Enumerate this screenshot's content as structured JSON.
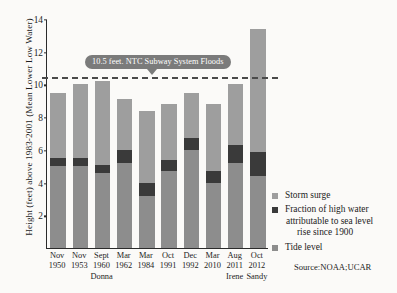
{
  "chart_data": {
    "type": "bar",
    "title": "",
    "subtitle": "",
    "xlabel": "",
    "ylabel": "Height (feet) above 1983-2001 (Mean Lower Low Water)",
    "ylim": [
      0,
      14
    ],
    "yticks": [
      2,
      4,
      6,
      8,
      10,
      12,
      14
    ],
    "grid": false,
    "stacked": true,
    "legend_position": "right",
    "categories": [
      "Nov 1950",
      "Nov 1953",
      "Sept 1960",
      "Mar 1962",
      "Mar 1984",
      "Oct 1991",
      "Dec 1992",
      "Mar 2010",
      "Aug 2011",
      "Oct 2012"
    ],
    "category_lines": [
      {
        "month": "Nov",
        "year": "1950",
        "storm": ""
      },
      {
        "month": "Nov",
        "year": "1953",
        "storm": ""
      },
      {
        "month": "Sept",
        "year": "1960",
        "storm": "Donna"
      },
      {
        "month": "Mar",
        "year": "1962",
        "storm": ""
      },
      {
        "month": "Mar",
        "year": "1984",
        "storm": ""
      },
      {
        "month": "Oct",
        "year": "1991",
        "storm": ""
      },
      {
        "month": "Dec",
        "year": "1992",
        "storm": ""
      },
      {
        "month": "Mar",
        "year": "2010",
        "storm": ""
      },
      {
        "month": "Aug",
        "year": "2011",
        "storm": "Irene"
      },
      {
        "month": "Oct",
        "year": "2012",
        "storm": "Sandy"
      }
    ],
    "series": [
      {
        "name": "Tide level",
        "color": "#8d8d8d",
        "values": [
          5.0,
          5.0,
          4.6,
          5.2,
          3.2,
          4.7,
          6.0,
          4.0,
          5.2,
          4.4
        ]
      },
      {
        "name": "Fraction of high water attributable to sea level rise since 1900",
        "color": "#3a3a3a",
        "values": [
          0.5,
          0.5,
          0.5,
          0.8,
          0.8,
          0.7,
          0.7,
          0.7,
          1.1,
          1.5
        ]
      },
      {
        "name": "Storm surge",
        "color": "#9e9e9e",
        "values": [
          4.0,
          4.5,
          5.1,
          3.1,
          4.4,
          3.4,
          2.8,
          4.1,
          3.7,
          7.5
        ]
      }
    ],
    "totals": [
      9.5,
      10.0,
      10.2,
      9.1,
      8.4,
      8.8,
      9.5,
      8.8,
      10.0,
      13.4
    ],
    "annotations": [
      {
        "name": "subway-flood-threshold",
        "label": "10.5 feet. NTC Subway System Floods",
        "value": 10.5,
        "style": "dashed-line-with-callout",
        "line_color": "#4a4a4a",
        "callout_bg": "#7b7b7b",
        "callout_fg": "#ffffff"
      }
    ],
    "legend": [
      {
        "label": "Storm surge",
        "color": "#9e9e9e",
        "lines": [
          "Storm surge"
        ]
      },
      {
        "label": "Fraction of high water attributable to sea level rise since 1900",
        "color": "#3a3a3a",
        "lines": [
          "Fraction of high water",
          "attributable to sea level",
          "rise since 1900"
        ]
      },
      {
        "label": "Tide level",
        "color": "#8d8d8d",
        "lines": [
          "Tide level"
        ]
      }
    ],
    "source": "Source:NOAA;UCAR"
  }
}
